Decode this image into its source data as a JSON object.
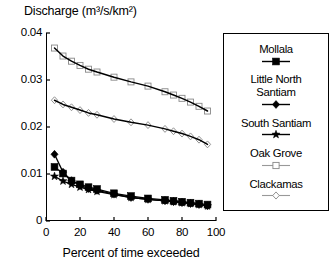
{
  "chart_data": {
    "type": "line",
    "title": "Discharge (m³/s/km²)",
    "xlabel": "Percent of time exceeded",
    "ylabel": "Discharge (m³/s/km²)",
    "xlim": [
      0,
      100
    ],
    "ylim": [
      0,
      0.04
    ],
    "xticks": [
      0,
      20,
      40,
      60,
      80,
      100
    ],
    "xtick_labels": [
      "0",
      "20",
      "40",
      "60",
      "80",
      "100"
    ],
    "yticks": [
      0,
      0.01,
      0.02,
      0.03,
      0.04
    ],
    "ytick_labels": [
      "0",
      "0.01",
      "0.02",
      "0.03",
      "0.04"
    ],
    "grid": false,
    "legend_position": "right",
    "x": [
      5,
      10,
      15,
      20,
      25,
      30,
      40,
      50,
      60,
      70,
      75,
      80,
      85,
      90,
      95
    ],
    "series": [
      {
        "name": "Mollala",
        "marker": "filled-square",
        "color": "#000000",
        "values": [
          0.0115,
          0.0101,
          0.0086,
          0.0078,
          0.0072,
          0.0068,
          0.0059,
          0.0053,
          0.0048,
          0.0045,
          0.0043,
          0.0041,
          0.0039,
          0.0037,
          0.0035
        ]
      },
      {
        "name": "Little North Santiam",
        "marker": "filled-diamond",
        "color": "#000000",
        "values": [
          0.0142,
          0.0104,
          0.0086,
          0.0076,
          0.0069,
          0.0065,
          0.0057,
          0.005,
          0.0046,
          0.0043,
          0.0041,
          0.0039,
          0.0037,
          0.0035,
          0.0032
        ]
      },
      {
        "name": "South Santiam",
        "marker": "filled-star",
        "color": "#000000",
        "values": [
          0.0095,
          0.0085,
          0.0078,
          0.0072,
          0.0067,
          0.0063,
          0.0056,
          0.005,
          0.0046,
          0.0043,
          0.0041,
          0.0039,
          0.0037,
          0.0035,
          0.0032
        ]
      },
      {
        "name": "Oak Grove",
        "marker": "open-square",
        "color": "#000000",
        "values": [
          0.0368,
          0.0351,
          0.034,
          0.0331,
          0.0323,
          0.0317,
          0.0306,
          0.0296,
          0.0287,
          0.0275,
          0.0268,
          0.0261,
          0.0253,
          0.0244,
          0.0234
        ]
      },
      {
        "name": "Clackamas",
        "marker": "open-diamond",
        "color": "#000000",
        "values": [
          0.0257,
          0.0248,
          0.0242,
          0.0236,
          0.023,
          0.0226,
          0.0217,
          0.021,
          0.0204,
          0.0196,
          0.0191,
          0.0186,
          0.018,
          0.0173,
          0.0163
        ]
      }
    ]
  },
  "legend": {
    "entries": [
      {
        "label": "Mollala",
        "marker": "filled-square"
      },
      {
        "label": "Little North\nSantiam",
        "marker": "filled-diamond"
      },
      {
        "label": "South Santiam",
        "marker": "filled-star"
      },
      {
        "label": "Oak Grove",
        "marker": "open-square"
      },
      {
        "label": "Clackamas",
        "marker": "open-diamond"
      }
    ]
  }
}
